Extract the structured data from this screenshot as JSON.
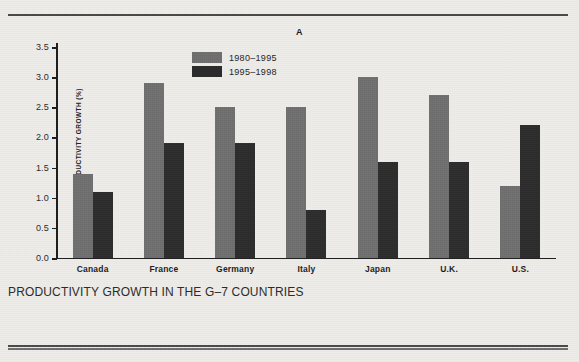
{
  "panel_label": "A",
  "caption": "PRODUCTIVITY GROWTH IN THE G–7 COUNTRIES",
  "colors": {
    "series_1980_1995": "#6f6f6f",
    "series_1995_1998": "#2a2a2a",
    "paper": "#eeedea",
    "rule": "#4a4a4a",
    "axis": "#1e1e1e"
  },
  "legend": {
    "position": "upper-center-left",
    "entries": [
      {
        "label": "1980–1995",
        "swatch": "#6f6f6f"
      },
      {
        "label": "1995–1998",
        "swatch": "#2a2a2a"
      }
    ]
  },
  "chart_data": {
    "type": "bar",
    "title": "A",
    "subtitle": "PRODUCTIVITY GROWTH IN THE G–7 COUNTRIES",
    "xlabel": "",
    "ylabel": "LABOR PRODUCTIVITY GROWTH (%)",
    "ylim": [
      0.0,
      3.5
    ],
    "yticks": [
      "0.0",
      "0.5",
      "1.0",
      "1.5",
      "2.0",
      "2.5",
      "3.0",
      "3.5"
    ],
    "ytick_values": [
      0.0,
      0.5,
      1.0,
      1.5,
      2.0,
      2.5,
      3.0,
      3.5
    ],
    "grid": false,
    "legend_position": "upper center",
    "categories": [
      "Canada",
      "France",
      "Germany",
      "Italy",
      "Japan",
      "U.K.",
      "U.S."
    ],
    "series": [
      {
        "name": "1980–1995",
        "color": "#6f6f6f",
        "values": [
          1.4,
          2.9,
          2.5,
          2.5,
          3.0,
          2.7,
          1.2
        ]
      },
      {
        "name": "1995–1998",
        "color": "#2a2a2a",
        "values": [
          1.1,
          1.9,
          1.9,
          0.8,
          1.6,
          1.6,
          2.2
        ]
      }
    ]
  }
}
